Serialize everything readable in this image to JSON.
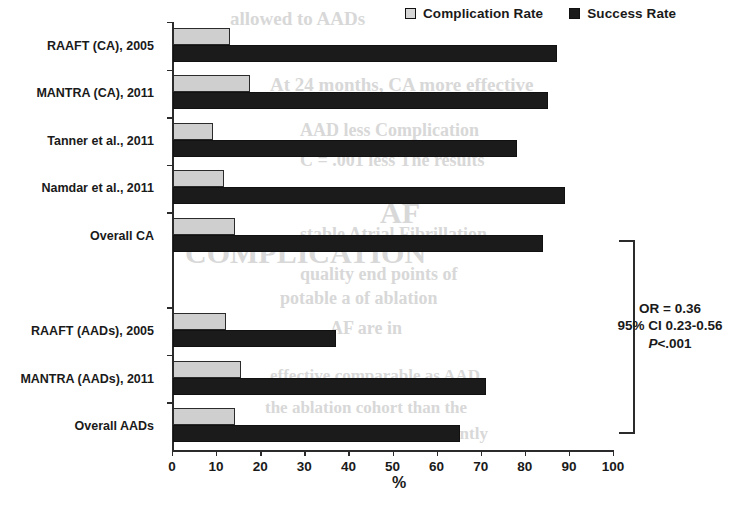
{
  "chart_data": {
    "type": "bar",
    "orientation": "horizontal",
    "title": "",
    "xlabel": "%",
    "ylabel": "",
    "xlim": [
      0,
      100
    ],
    "xticks": [
      0,
      10,
      20,
      30,
      40,
      50,
      60,
      70,
      80,
      90,
      100
    ],
    "grid": false,
    "legend_position": "top-right",
    "categories": [
      "RAAFT (CA), 2005",
      "MANTRA (CA), 2011",
      "Tanner et al., 2011",
      "Namdar et al., 2011",
      "Overall CA",
      "",
      "RAAFT (AADs), 2005",
      "MANTRA (AADs), 2011",
      "Overall AADs"
    ],
    "series": [
      {
        "name": "Complication Rate",
        "color": "#cfcfcf",
        "values": [
          13,
          17.5,
          9,
          11.5,
          14,
          null,
          12,
          15.5,
          14
        ]
      },
      {
        "name": "Success Rate",
        "color": "#1b1b1b",
        "values": [
          87,
          85,
          78,
          89,
          84,
          null,
          37,
          71,
          65
        ]
      }
    ],
    "annotations": [
      "OR = 0.36",
      "95% CI 0.23-0.56",
      "P<.001"
    ]
  },
  "legend": {
    "items": [
      {
        "label": "Complication Rate",
        "swatch": "light"
      },
      {
        "label": "Success Rate",
        "swatch": "dark"
      }
    ]
  },
  "axis": {
    "x_title": "%",
    "tick_labels": [
      "0",
      "10",
      "20",
      "30",
      "40",
      "50",
      "60",
      "70",
      "80",
      "90",
      "100"
    ]
  },
  "stats_box": {
    "line1": "OR = 0.36",
    "line2": "95% CI 0.23-0.56",
    "line3_prefix": "P",
    "line3_rest": "<.001"
  },
  "ghost_text": [
    {
      "text": "allowed to AADs",
      "x": 230,
      "y": 8,
      "size": 19
    },
    {
      "text": "At 24 months, CA more effective",
      "x": 270,
      "y": 74,
      "size": 19
    },
    {
      "text": "AAD less Complication",
      "x": 300,
      "y": 120,
      "size": 18
    },
    {
      "text": "C = .001 less   The results",
      "x": 300,
      "y": 150,
      "size": 18
    },
    {
      "text": "stable   Atrial Fibrillation",
      "x": 300,
      "y": 224,
      "size": 18
    },
    {
      "text": "quality    end   points   of",
      "x": 300,
      "y": 264,
      "size": 18
    },
    {
      "text": "potable a   of ablation",
      "x": 280,
      "y": 288,
      "size": 18
    },
    {
      "text": "AF are in",
      "x": 330,
      "y": 318,
      "size": 18
    },
    {
      "text": "effective    comparable  as AAD",
      "x": 270,
      "y": 366,
      "size": 17
    },
    {
      "text": "the ablation cohort than the",
      "x": 265,
      "y": 398,
      "size": 17
    },
    {
      "text": "the enrollment and in currently",
      "x": 260,
      "y": 424,
      "size": 17
    },
    {
      "text": "COMPLICATION",
      "x": 185,
      "y": 236,
      "size": 30
    },
    {
      "text": "AF",
      "x": 380,
      "y": 196,
      "size": 30
    }
  ]
}
